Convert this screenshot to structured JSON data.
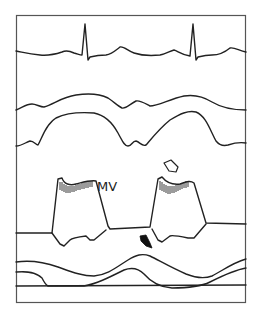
{
  "figure": {
    "colors": {
      "stroke": "#222222",
      "frame": "#555555",
      "background": "#ffffff"
    },
    "traces": [
      {
        "name": "ecg",
        "label": ""
      },
      {
        "name": "aortic-root-anterior-wall",
        "label": ""
      },
      {
        "name": "aortic-root-posterior-wall",
        "label": ""
      },
      {
        "name": "mitral-valve-anterior-leaflet",
        "label": "MV"
      },
      {
        "name": "left-ventricular-posterior-wall",
        "label": ""
      },
      {
        "name": "epicardium",
        "label": ""
      },
      {
        "name": "pericardium",
        "label": ""
      }
    ],
    "annotations": [
      {
        "type": "open-arrow",
        "description": "Open (white) arrow pointing at fluttering mitral leaflet in second cycle"
      },
      {
        "type": "filled-arrow",
        "description": "Filled (black) arrow pointing at mitral valve closure point"
      }
    ],
    "mv_label": "MV"
  }
}
